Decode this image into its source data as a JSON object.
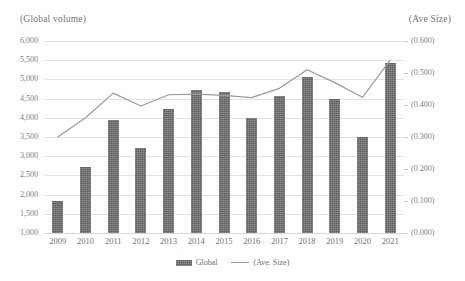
{
  "chart_data": {
    "type": "bar",
    "title": "",
    "xlabel": "",
    "ylabel": "(Global volume)",
    "y2label": "(Ave Size)",
    "grid": true,
    "legend_position": "bottom",
    "categories": [
      "2009",
      "2010",
      "2011",
      "2012",
      "2013",
      "2014",
      "2015",
      "2016",
      "2017",
      "2018",
      "2019",
      "2020",
      "2021"
    ],
    "ylim": [
      1000,
      6000
    ],
    "ytick_labels": [
      "6,000",
      "5,500",
      "5,000",
      "4,500",
      "4,000",
      "3,500",
      "3,000",
      "2,500",
      "2,000",
      "1,500",
      "1,000"
    ],
    "ytick_values": [
      6000,
      5500,
      5000,
      4500,
      4000,
      3500,
      3000,
      2500,
      2000,
      1500,
      1000
    ],
    "y2lim": [
      0.0,
      0.6
    ],
    "y2tick_labels": [
      "(0.600)",
      "(0.500)",
      "(0.400)",
      "(0.300)",
      "(0.200)",
      "(0.100)",
      "(0.000)"
    ],
    "y2tick_values": [
      0.6,
      0.5,
      0.4,
      0.3,
      0.2,
      0.1,
      0.0
    ],
    "series": [
      {
        "name": "Global",
        "legend_label": "Global",
        "kind": "bar",
        "axis": "left",
        "color": "#5e5e5e",
        "values": [
          1830,
          2720,
          3940,
          3220,
          4240,
          4730,
          4670,
          4000,
          4570,
          5050,
          4480,
          3500,
          5420
        ]
      },
      {
        "name": "(Ave. Size)",
        "legend_label": "(Ave. Size)",
        "kind": "line",
        "axis": "right",
        "color": "#9b9b9b",
        "values": [
          0.3,
          0.36,
          0.437,
          0.397,
          0.432,
          0.434,
          0.43,
          0.423,
          0.452,
          0.51,
          0.47,
          0.424,
          0.54
        ]
      }
    ]
  }
}
